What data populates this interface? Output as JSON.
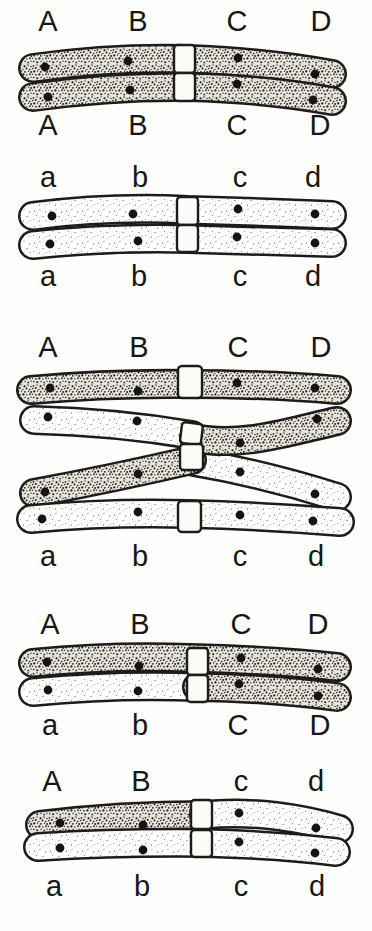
{
  "figure": {
    "type": "chromosome-crossing-over-diagram",
    "colors": {
      "ink": "#1c1c1c",
      "paper": "#fefefc",
      "dark_chromatid_base": "#e7e3db",
      "light_chromatid_base": "#fdfdfb"
    }
  },
  "panels": [
    {
      "id": "parental-dark-pair",
      "top_labels": [
        "A",
        "B",
        "C",
        "D"
      ],
      "bottom_labels": [
        "A",
        "B",
        "C",
        "D"
      ]
    },
    {
      "id": "parental-light-pair",
      "top_labels": [
        "a",
        "b",
        "c",
        "d"
      ],
      "bottom_labels": [
        "a",
        "b",
        "c",
        "d"
      ]
    },
    {
      "id": "crossing-over-tetrad",
      "top_labels": [
        "A",
        "B",
        "C",
        "D"
      ],
      "bottom_labels": [
        "a",
        "b",
        "c",
        "d"
      ]
    },
    {
      "id": "recombinant-pair-upper",
      "top_labels": [
        "A",
        "B",
        "C",
        "D"
      ],
      "bottom_labels": [
        "a",
        "b",
        "C",
        "D"
      ]
    },
    {
      "id": "recombinant-pair-lower",
      "top_labels": [
        "A",
        "B",
        "c",
        "d"
      ],
      "bottom_labels": [
        "a",
        "b",
        "c",
        "d"
      ]
    }
  ]
}
